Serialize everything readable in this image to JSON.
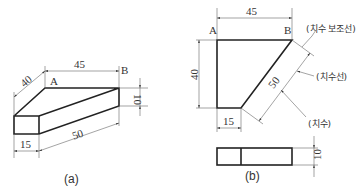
{
  "diagram_a": {
    "caption": "(a)",
    "point_labels": {
      "a": "A",
      "b": "B"
    },
    "dimensions": {
      "depth": "40",
      "top_length": "45",
      "height": "10",
      "bottom_length": "50",
      "front_width": "15"
    }
  },
  "diagram_b": {
    "caption": "(b)",
    "point_labels": {
      "a": "A",
      "b": "B"
    },
    "dimensions": {
      "top_length": "45",
      "left_height": "40",
      "slant_length": "50",
      "bottom_width": "15",
      "thickness": "10"
    },
    "annotations": {
      "extension_line": "(치수 보조선)",
      "dimension_line": "(치수선)",
      "dimension_value": "(치수)"
    }
  },
  "colors": {
    "line": "#222222",
    "thin_line": "#666666",
    "background": "#ffffff"
  }
}
